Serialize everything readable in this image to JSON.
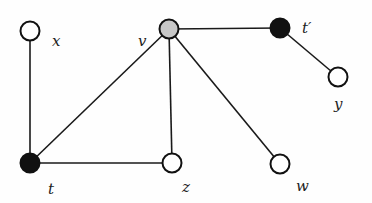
{
  "diagram": {
    "type": "graph",
    "nodes": [
      {
        "id": "x",
        "label": "x",
        "cx": 30,
        "cy": 31,
        "fill": "#ffffff",
        "lx": 52,
        "ly": 34
      },
      {
        "id": "v",
        "label": "v",
        "cx": 169,
        "cy": 29,
        "fill": "#c8c8c8",
        "lx": 138,
        "ly": 34
      },
      {
        "id": "t_prime",
        "label": "t′",
        "cx": 280,
        "cy": 28,
        "fill": "#111111",
        "lx": 302,
        "ly": 21
      },
      {
        "id": "y",
        "label": "y",
        "cx": 338,
        "cy": 77,
        "fill": "#ffffff",
        "lx": 334,
        "ly": 97
      },
      {
        "id": "t",
        "label": "t",
        "cx": 30,
        "cy": 163,
        "fill": "#111111",
        "lx": 48,
        "ly": 182
      },
      {
        "id": "z",
        "label": "z",
        "cx": 172,
        "cy": 163,
        "fill": "#ffffff",
        "lx": 182,
        "ly": 180
      },
      {
        "id": "w",
        "label": "w",
        "cx": 280,
        "cy": 164,
        "fill": "#ffffff",
        "lx": 296,
        "ly": 179
      }
    ],
    "edges": [
      {
        "from": "x",
        "to": "t"
      },
      {
        "from": "v",
        "to": "t"
      },
      {
        "from": "v",
        "to": "z"
      },
      {
        "from": "v",
        "to": "w"
      },
      {
        "from": "v",
        "to": "t_prime"
      },
      {
        "from": "t_prime",
        "to": "y"
      },
      {
        "from": "t",
        "to": "z"
      }
    ]
  },
  "labels": {
    "x": "x",
    "v": "v",
    "t_prime": "t′",
    "y": "y",
    "t": "t",
    "z": "z",
    "w": "w"
  }
}
